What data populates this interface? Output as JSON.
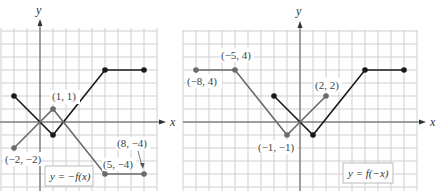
{
  "panels": [
    {
      "name": "left",
      "caption": "y = −f(x)",
      "axis_labels": {
        "x": "x",
        "y": "y"
      },
      "x_range": [
        -3,
        9
      ],
      "y_range": [
        -5,
        7
      ],
      "origin_px": [
        40,
        122
      ],
      "unit_px": 13,
      "curves": [
        {
          "name": "f",
          "color": "#1a1a1a",
          "points": [
            [
              -2,
              2
            ],
            [
              1,
              -1
            ],
            [
              5,
              4
            ],
            [
              8,
              4
            ]
          ]
        },
        {
          "name": "-f",
          "color": "#6b6b6b",
          "points": [
            [
              -2,
              -2
            ],
            [
              1,
              1
            ],
            [
              5,
              -4
            ],
            [
              8,
              -4
            ]
          ]
        }
      ],
      "annotations": [
        {
          "text": "(1, 1)",
          "x": 1,
          "y": 1
        },
        {
          "text": "(−2, −2)",
          "x": -2,
          "y": -2
        },
        {
          "text": "(5, −4)",
          "x": 5,
          "y": -4
        },
        {
          "text": "(8, −4)",
          "x": 8,
          "y": -4
        }
      ]
    },
    {
      "name": "right",
      "caption": "y = f(−x)",
      "axis_labels": {
        "x": "x",
        "y": "y"
      },
      "x_range": [
        -9,
        9
      ],
      "y_range": [
        -5,
        7
      ],
      "origin_px": [
        300,
        122
      ],
      "unit_px": 13,
      "curves": [
        {
          "name": "f",
          "color": "#1a1a1a",
          "points": [
            [
              -2,
              2
            ],
            [
              1,
              -1
            ],
            [
              5,
              4
            ],
            [
              8,
              4
            ]
          ]
        },
        {
          "name": "f(-x)",
          "color": "#6b6b6b",
          "points": [
            [
              -8,
              4
            ],
            [
              -5,
              4
            ],
            [
              -1,
              -1
            ],
            [
              2,
              2
            ]
          ]
        }
      ],
      "annotations": [
        {
          "text": "(−5, 4)",
          "x": -5,
          "y": 4
        },
        {
          "text": "(−8, 4)",
          "x": -8,
          "y": 4
        },
        {
          "text": "(2, 2)",
          "x": 2,
          "y": 2
        },
        {
          "text": "(−1, −1)",
          "x": -1,
          "y": -1
        }
      ]
    }
  ],
  "labels": {
    "left_caption": "y = −f(x)",
    "right_caption": "y = f(−x)",
    "x": "x",
    "y": "y",
    "l_a1": "(1, 1)",
    "l_a2": "(−2, −2)",
    "l_a3": "(5, −4)",
    "l_a4": "(8, −4)",
    "r_a1": "(−5, 4)",
    "r_a2": "(−8, 4)",
    "r_a3": "(2, 2)",
    "r_a4": "(−1, −1)"
  }
}
